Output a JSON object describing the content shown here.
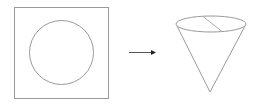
{
  "diagram": {
    "stroke_color": "#999999",
    "arrow_color": "#333333",
    "elements": [
      "square-sheet",
      "circle",
      "arrow",
      "cone"
    ]
  }
}
